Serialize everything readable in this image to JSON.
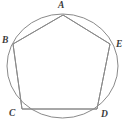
{
  "figure": {
    "name": "regular-pentagon-inscribed-in-circle",
    "background_color": "#ffffff",
    "stroke_color": "#8a8a8a",
    "label_color": "#3b3b3b",
    "stroke_width": 1,
    "circle": {
      "center_x": 62.5,
      "center_y": 66,
      "radius_x": 55.5,
      "radius_y": 52
    },
    "vertices": [
      {
        "id": "A",
        "label": "A",
        "x": 63,
        "y": 15,
        "position": "top"
      },
      {
        "id": "B",
        "label": "B",
        "x": 13,
        "y": 44,
        "position": "upper-left"
      },
      {
        "id": "C",
        "label": "C",
        "x": 22,
        "y": 109,
        "position": "lower-left"
      },
      {
        "id": "D",
        "label": "D",
        "x": 97,
        "y": 109,
        "position": "lower-right"
      },
      {
        "id": "E",
        "label": "E",
        "x": 110,
        "y": 44,
        "position": "upper-right"
      }
    ],
    "edges": [
      {
        "from": "A",
        "to": "B"
      },
      {
        "from": "B",
        "to": "C"
      },
      {
        "from": "C",
        "to": "D"
      },
      {
        "from": "D",
        "to": "E"
      },
      {
        "from": "E",
        "to": "A"
      }
    ],
    "polygon_points": "63,15 13,44 22,109 97,109 110,44"
  }
}
